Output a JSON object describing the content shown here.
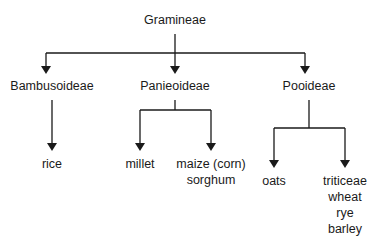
{
  "diagram": {
    "type": "tree",
    "root": {
      "label": "Gramineae",
      "children": [
        {
          "label": "Bambusoideae",
          "children": [
            {
              "lines": [
                "rice"
              ]
            }
          ]
        },
        {
          "label": "Panieoideae",
          "children": [
            {
              "lines": [
                "millet"
              ]
            },
            {
              "lines": [
                "maize (corn)",
                "sorghum"
              ]
            }
          ]
        },
        {
          "label": "Pooideae",
          "children": [
            {
              "lines": [
                "oats"
              ]
            },
            {
              "lines": [
                "triticeae",
                "wheat",
                "rye",
                "barley"
              ]
            }
          ]
        }
      ]
    },
    "colors": {
      "line": "#1a1a1a",
      "text": "#1a1a1a",
      "background": "#ffffff"
    }
  }
}
